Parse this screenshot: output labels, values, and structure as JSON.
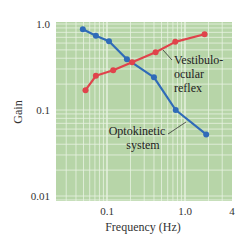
{
  "chart_data": {
    "type": "line",
    "title": "",
    "xlabel": "Frequency (Hz)",
    "ylabel": "Gain",
    "xscale": "log",
    "yscale": "log",
    "xlim": [
      0.02,
      4
    ],
    "ylim": [
      0.01,
      1.0
    ],
    "x_ticks": [
      0.1,
      1.0,
      4
    ],
    "x_tick_labels": [
      "0.1",
      "1.0",
      "4"
    ],
    "y_ticks": [
      0.01,
      0.1,
      1.0
    ],
    "y_tick_labels": [
      "0.01",
      "0.1",
      "1.0"
    ],
    "grid": true,
    "background": "#b7d5a8",
    "series": [
      {
        "name": "Optokinetic system",
        "label_lines": [
          "Optokinetic",
          "system"
        ],
        "color": "#2f6bb8",
        "x": [
          0.049,
          0.072,
          0.106,
          0.18,
          0.4,
          0.76,
          1.87
        ],
        "y": [
          0.87,
          0.73,
          0.63,
          0.39,
          0.24,
          0.1,
          0.052
        ]
      },
      {
        "name": "Vestibulo-ocular reflex",
        "label_lines": [
          "Vestibulo-",
          "ocular",
          "reflex"
        ],
        "color": "#e0434b",
        "x": [
          0.053,
          0.072,
          0.12,
          0.21,
          0.42,
          0.75,
          1.78
        ],
        "y": [
          0.17,
          0.25,
          0.29,
          0.36,
          0.47,
          0.62,
          0.76
        ]
      }
    ]
  }
}
